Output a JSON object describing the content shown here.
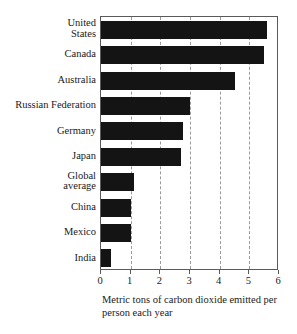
{
  "chart_data": {
    "type": "bar",
    "orientation": "horizontal",
    "title": "",
    "subtitle": "",
    "xlabel": "Metric tons of carbon dioxide emitted per person each year",
    "ylabel": "",
    "xlim": [
      0,
      6
    ],
    "ylim": null,
    "grid": true,
    "grid_axis": "x",
    "grid_style": "dashed",
    "legend": null,
    "legend_position": "none",
    "bar_color": "#141414",
    "categories": [
      "United States",
      "Canada",
      "Australia",
      "Russian Federation",
      "Germany",
      "Japan",
      "Global average",
      "China",
      "Mexico",
      "India"
    ],
    "category_lines": [
      [
        "United",
        "States"
      ],
      [
        "Canada"
      ],
      [
        "Australia"
      ],
      [
        "Russian Federation"
      ],
      [
        "Germany"
      ],
      [
        "Japan"
      ],
      [
        "Global",
        "average"
      ],
      [
        "China"
      ],
      [
        "Mexico"
      ],
      [
        "India"
      ]
    ],
    "values": [
      5.6,
      5.5,
      4.5,
      3.0,
      2.75,
      2.7,
      1.1,
      1.0,
      1.0,
      0.35
    ],
    "xticks": [
      0,
      1,
      2,
      3,
      4,
      5,
      6
    ],
    "xtick_labels": [
      "0",
      "1",
      "2",
      "3",
      "4",
      "5",
      "6"
    ]
  },
  "caption": {
    "line1": "Metric tons of carbon dioxide emitted per",
    "line2": "person each year"
  }
}
